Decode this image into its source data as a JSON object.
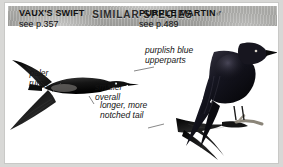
{
  "header": {
    "title": "SIMILAR SPECIES"
  },
  "species": [
    {
      "id": "vauxs-swift",
      "name": "VAUX'S SWIFT",
      "page_ref": "see p.357",
      "sex_symbol": ""
    },
    {
      "id": "purple-martin",
      "name": "PURPLE MARTIN",
      "page_ref": "see p.489",
      "sex_symbol": "♂"
    }
  ],
  "annotations": [
    {
      "id": "purplish-blue-upperparts",
      "line1": "purplish blue",
      "line2": "upperparts"
    },
    {
      "id": "paler-rump",
      "line1": "paler",
      "line2": "rump"
    },
    {
      "id": "smaller-overall",
      "line1": "smaller",
      "line2": "overall"
    },
    {
      "id": "longer-more-notched-tail",
      "line1": "longer, more",
      "line2": "notched tail"
    }
  ],
  "colors": {
    "header_band": "#a9a9a6",
    "panel_background": "#ffffff",
    "outer_background": "#d8d8d6",
    "text": "#111111",
    "bird_plumage": "#1a1a1a",
    "leader_line": "#555555"
  }
}
